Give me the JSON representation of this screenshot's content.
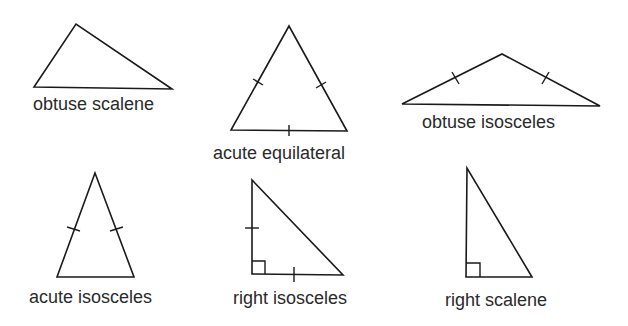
{
  "triangles": [
    {
      "label": "obtuse scalene",
      "angle_type": "obtuse",
      "side_type": "scalene",
      "equal_side_marks": 0,
      "right_angle_marker": false
    },
    {
      "label": "acute equilateral",
      "angle_type": "acute",
      "side_type": "equilateral",
      "equal_side_marks": 3,
      "right_angle_marker": false
    },
    {
      "label": "obtuse isosceles",
      "angle_type": "obtuse",
      "side_type": "isosceles",
      "equal_side_marks": 2,
      "right_angle_marker": false
    },
    {
      "label": "acute isosceles",
      "angle_type": "acute",
      "side_type": "isosceles",
      "equal_side_marks": 2,
      "right_angle_marker": false
    },
    {
      "label": "right isosceles",
      "angle_type": "right",
      "side_type": "isosceles",
      "equal_side_marks": 2,
      "right_angle_marker": true
    },
    {
      "label": "right scalene",
      "angle_type": "right",
      "side_type": "scalene",
      "equal_side_marks": 0,
      "right_angle_marker": true
    }
  ],
  "colors": {
    "stroke": "#1a1a1a",
    "text": "#2a2a2a",
    "background": "#ffffff"
  }
}
